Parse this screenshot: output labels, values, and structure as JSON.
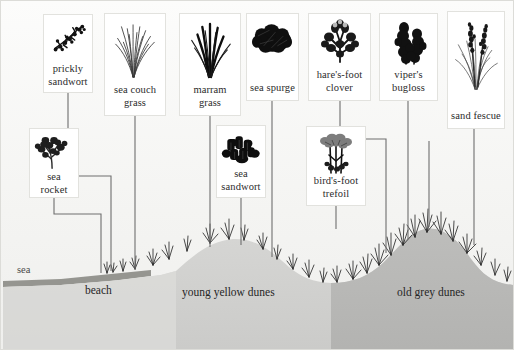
{
  "figure": {
    "background_color": "#f4f4f2",
    "line_color": "#6e6e6e"
  },
  "zones": [
    {
      "name": "sea",
      "label": "sea",
      "x": 16,
      "y": 265,
      "color": "#4a4a4a"
    },
    {
      "name": "beach",
      "label": "beach",
      "x": 84,
      "y": 287,
      "color": "#262626"
    },
    {
      "name": "young",
      "label": "young yellow dunes",
      "x": 183,
      "y": 289,
      "color": "#262626"
    },
    {
      "name": "old",
      "label": "old grey dunes",
      "x": 398,
      "y": 289,
      "color": "#262626"
    }
  ],
  "ground": {
    "sea_band_color": "#8b8b86",
    "beach_color": "#dedede",
    "young_dune_color": "#d2d2d0",
    "old_dune_color": "#b9b9b7"
  },
  "plants": [
    {
      "id": "prickly-sandwort",
      "label": "prickly sandwort",
      "icon": "shrub-icon",
      "card": {
        "x": 42,
        "y": 13,
        "w": 50,
        "h": 79
      }
    },
    {
      "id": "sea-couch-grass",
      "label": "sea couch grass",
      "icon": "grass-tuft-icon",
      "card": {
        "x": 103,
        "y": 12,
        "w": 62,
        "h": 103
      }
    },
    {
      "id": "marram-grass",
      "label": "marram grass",
      "icon": "grass-blades-icon",
      "card": {
        "x": 178,
        "y": 12,
        "w": 62,
        "h": 103
      }
    },
    {
      "id": "sea-spurge",
      "label": "sea spurge",
      "icon": "dense-clump-icon",
      "card": {
        "x": 245,
        "y": 12,
        "w": 53,
        "h": 88
      }
    },
    {
      "id": "hares-foot-clover",
      "label": "hare's-foot clover",
      "icon": "clover-icon",
      "card": {
        "x": 307,
        "y": 12,
        "w": 63,
        "h": 88
      }
    },
    {
      "id": "vipers-bugloss",
      "label": "viper's bugloss",
      "icon": "spike-flower-icon",
      "card": {
        "x": 378,
        "y": 12,
        "w": 59,
        "h": 88
      }
    },
    {
      "id": "sand-fescue",
      "label": "sand fescue",
      "icon": "fescue-icon",
      "card": {
        "x": 446,
        "y": 10,
        "w": 58,
        "h": 118
      }
    },
    {
      "id": "sea-rocket",
      "label": "sea rocket",
      "icon": "branched-herb-icon",
      "card": {
        "x": 28,
        "y": 127,
        "w": 50,
        "h": 70
      }
    },
    {
      "id": "sea-sandwort",
      "label": "sea sandwort",
      "icon": "succulent-icon",
      "card": {
        "x": 215,
        "y": 124,
        "w": 50,
        "h": 73
      }
    },
    {
      "id": "birds-foot-trefoil",
      "label": "bird's-foot trefoil",
      "icon": "umbel-flower-icon",
      "card": {
        "x": 305,
        "y": 125,
        "w": 60,
        "h": 80
      }
    }
  ],
  "connectors": {
    "paths": [
      "M 67 92 L 67 175 L 110 175 L 110 270",
      "M 134 115 L 134 268",
      "M 209 115 L 209 255",
      "M 271 100 L 271 262",
      "M 339 100 L 339 138 L 385 138 L 385 245",
      "M 407 100 L 407 233",
      "M 473 128 L 473 232",
      "M 53 197 L 53 213 L 100 213 L 100 272",
      "M 240 197 L 240 250",
      "M 335 205 L 335 228",
      "M 428 140 L 428 240"
    ]
  }
}
